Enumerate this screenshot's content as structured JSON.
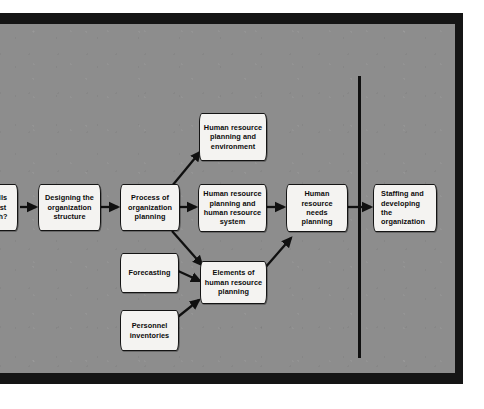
{
  "figure": {
    "kind": "flow-diagram",
    "background_color": "#8d8d8d",
    "frame_color": "#151515",
    "box_fill": "#f4f3f1",
    "ink_color": "#0c0c0c"
  },
  "nodes": [
    {
      "id": "skills-question",
      "label": "lls\nst\nh?",
      "lines": [
        "lls",
        "st",
        "h?"
      ],
      "note": "clipped at left edge of image"
    },
    {
      "id": "designing-organization-structure",
      "label": "Designing the organization structure",
      "lines": [
        "Designing  the",
        "organization",
        "structure"
      ]
    },
    {
      "id": "process-of-organization-planning",
      "label": "Process of organization planning",
      "lines": [
        "Process of",
        "organization",
        "planning"
      ]
    },
    {
      "id": "hr-planning-and-environment",
      "label": "Human resource planning and environment",
      "lines": [
        "Human",
        "resource",
        "planning and",
        "environment"
      ]
    },
    {
      "id": "hr-planning-and-hr-system",
      "label": "Human resource planning and human resource system",
      "lines": [
        "Human resource",
        "planning and",
        "human resource",
        "system"
      ]
    },
    {
      "id": "hr-needs-planning",
      "label": "Human resource needs planning",
      "lines": [
        "Human",
        "resource",
        "needs",
        "planning"
      ]
    },
    {
      "id": "staffing-and-developing",
      "label": "Staffing and developing the organization",
      "lines": [
        "Staffing and",
        "developing",
        "the",
        "organization"
      ]
    },
    {
      "id": "forecasting",
      "label": "Forecasting",
      "lines": [
        "Forecasting"
      ]
    },
    {
      "id": "elements-of-hr-planning",
      "label": "Elements of human resource planning",
      "lines": [
        "Elements of",
        "human resource",
        "planning"
      ]
    },
    {
      "id": "personnel-inventories",
      "label": "Personnel inventories",
      "lines": [
        "Personnel",
        "inventories"
      ]
    }
  ],
  "connections": [
    {
      "from": "skills-question",
      "to": "designing-organization-structure",
      "style": "straight-arrow"
    },
    {
      "from": "designing-organization-structure",
      "to": "process-of-organization-planning",
      "style": "straight-arrow"
    },
    {
      "from": "process-of-organization-planning",
      "to": "hr-planning-and-environment",
      "style": "diagonal-arrow-up"
    },
    {
      "from": "process-of-organization-planning",
      "to": "hr-planning-and-hr-system",
      "style": "straight-arrow"
    },
    {
      "from": "process-of-organization-planning",
      "to": "elements-of-hr-planning",
      "style": "diagonal-arrow-down"
    },
    {
      "from": "hr-planning-and-hr-system",
      "to": "hr-needs-planning",
      "style": "straight-arrow"
    },
    {
      "from": "forecasting",
      "to": "elements-of-hr-planning",
      "style": "diagonal-arrow-down"
    },
    {
      "from": "personnel-inventories",
      "to": "elements-of-hr-planning",
      "style": "diagonal-arrow-up"
    },
    {
      "from": "elements-of-hr-planning",
      "to": "hr-needs-planning",
      "style": "diagonal-arrow-up"
    },
    {
      "from": "hr-needs-planning",
      "to": "staffing-and-developing",
      "style": "straight-arrow-through-divider"
    }
  ],
  "divider": {
    "orientation": "vertical",
    "color": "#101010"
  }
}
